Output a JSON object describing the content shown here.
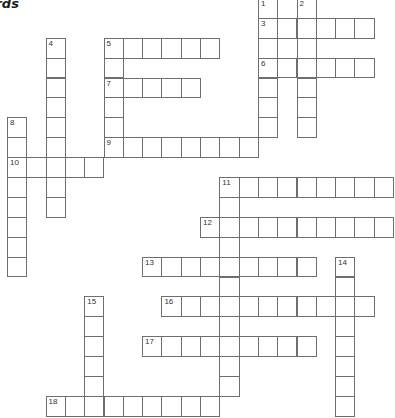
{
  "title": "ords",
  "grid": {
    "origin_x": 7,
    "origin_y": -2.1,
    "cell_w": 19.3,
    "cell_h": 19.9
  },
  "across": [
    {
      "number": "3",
      "row": 1,
      "col": 13,
      "length": 6
    },
    {
      "number": "5",
      "row": 2,
      "col": 5,
      "length": 6
    },
    {
      "number": "6",
      "row": 3,
      "col": 13,
      "length": 6
    },
    {
      "number": "7",
      "row": 4,
      "col": 5,
      "length": 5
    },
    {
      "number": "9",
      "row": 7,
      "col": 5,
      "length": 8
    },
    {
      "number": "10",
      "row": 8,
      "col": 0,
      "length": 5
    },
    {
      "number": "11",
      "row": 9,
      "col": 11,
      "length": 9
    },
    {
      "number": "12",
      "row": 11,
      "col": 10,
      "length": 10
    },
    {
      "number": "13",
      "row": 13,
      "col": 7,
      "length": 9
    },
    {
      "number": "16",
      "row": 15,
      "col": 8,
      "length": 11
    },
    {
      "number": "17",
      "row": 17,
      "col": 7,
      "length": 9
    },
    {
      "number": "18",
      "row": 20,
      "col": 2,
      "length": 9
    }
  ],
  "down": [
    {
      "number": "1",
      "row": 0,
      "col": 13,
      "length": 7
    },
    {
      "number": "2",
      "row": 0,
      "col": 15,
      "length": 7
    },
    {
      "number": "4",
      "row": 2,
      "col": 2,
      "length": 9
    },
    {
      "number": "5",
      "row": 2,
      "col": 5,
      "length": 6
    },
    {
      "number": "8",
      "row": 6,
      "col": 0,
      "length": 8
    },
    {
      "number": "11",
      "row": 9,
      "col": 11,
      "length": 11
    },
    {
      "number": "14",
      "row": 13,
      "col": 17,
      "length": 8
    },
    {
      "number": "15",
      "row": 15,
      "col": 4,
      "length": 6
    }
  ]
}
